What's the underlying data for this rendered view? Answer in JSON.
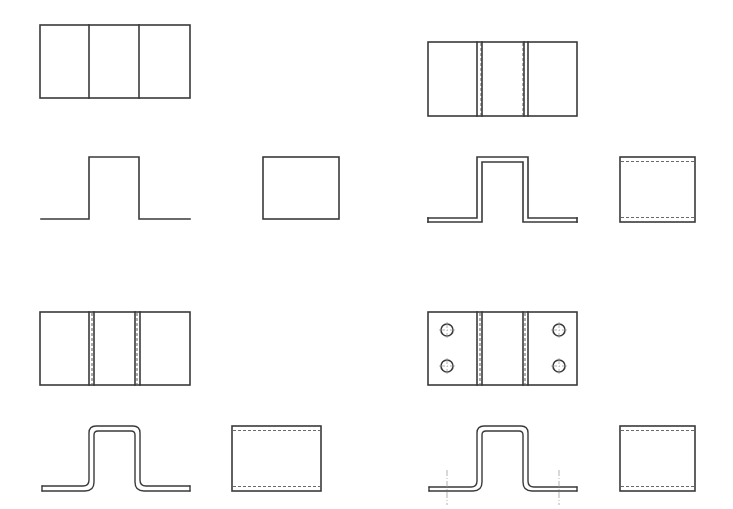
{
  "figure": {
    "colors": {
      "line": "#3a3a3a",
      "hidden_line": "#6a6a6a",
      "centerline": "#a0a0a0",
      "background": "#ffffff"
    },
    "panels": [
      {
        "id": "step-1",
        "label": "Sharp-corner bracket (single line)",
        "features": [
          "plan view with 3 regions",
          "zero-thickness profile",
          "side view rectangle"
        ]
      },
      {
        "id": "step-2",
        "label": "Bracket with material thickness",
        "features": [
          "double fold lines",
          "thick profile",
          "hidden lines in side view"
        ]
      },
      {
        "id": "step-3",
        "label": "Bracket with bend radii",
        "features": [
          "double fold lines",
          "rounded profile corners",
          "hidden lines in side view"
        ]
      },
      {
        "id": "step-4",
        "label": "Bracket with mounting holes",
        "features": [
          "4 holes in flanges",
          "rounded profile",
          "hole centerlines"
        ],
        "hole_count": 4
      }
    ]
  }
}
